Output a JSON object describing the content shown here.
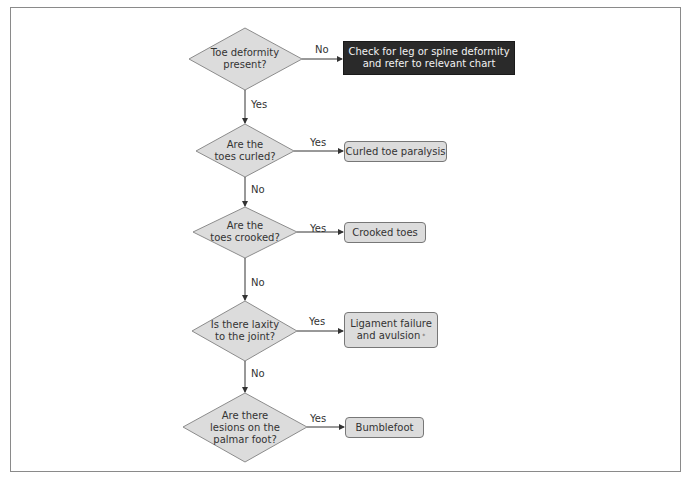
{
  "flowchart": {
    "decisions": [
      {
        "id": "d1",
        "lines": [
          "Toe deformity",
          "present?"
        ]
      },
      {
        "id": "d2",
        "lines": [
          "Are the",
          "toes curled?"
        ]
      },
      {
        "id": "d3",
        "lines": [
          "Are the",
          "toes crooked?"
        ]
      },
      {
        "id": "d4",
        "lines": [
          "Is there laxity",
          "to the joint?"
        ]
      },
      {
        "id": "d5",
        "lines": [
          "Are there",
          "lesions on the",
          "palmar foot?"
        ]
      }
    ],
    "outcomes": [
      {
        "id": "o1",
        "lines": [
          "Check for leg or spine deformity",
          "and refer to relevant chart"
        ],
        "style": "dark"
      },
      {
        "id": "o2",
        "lines": [
          "Curled toe paralysis"
        ],
        "style": "light"
      },
      {
        "id": "o3",
        "lines": [
          "Crooked toes"
        ],
        "style": "light"
      },
      {
        "id": "o4",
        "lines": [
          "Ligament failure",
          "and avulsion"
        ],
        "style": "light",
        "footnote_mark": "*"
      },
      {
        "id": "o5",
        "lines": [
          "Bumblefoot"
        ],
        "style": "light"
      }
    ],
    "edge_labels": {
      "d1_to_o1": "No",
      "d1_to_d2": "Yes",
      "d2_to_o2": "Yes",
      "d2_to_d3": "No",
      "d3_to_o3": "Yes",
      "d3_to_d4": "No",
      "d4_to_o4": "Yes",
      "d4_to_d5": "No",
      "d5_to_o5": "Yes"
    }
  },
  "colors": {
    "diamond_fill": "#dcdcdc",
    "diamond_stroke": "#8c8c8c",
    "box_light_fill": "#dcdcdc",
    "box_dark_fill": "#2a2a2a",
    "line": "#333333"
  }
}
